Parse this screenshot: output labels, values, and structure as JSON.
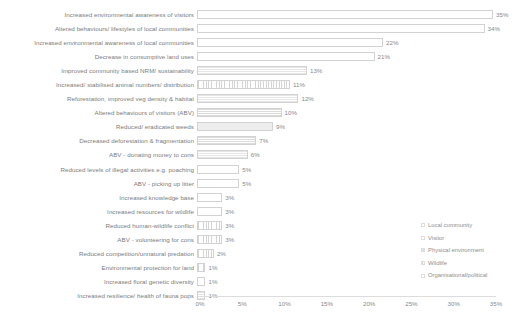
{
  "chart_data": {
    "type": "bar",
    "orientation": "horizontal",
    "title": "",
    "xlabel": "",
    "ylabel": "",
    "xlim": [
      0,
      35
    ],
    "grid": false,
    "legend_position": "right-lower",
    "tick_labels": [
      "0%",
      "5%",
      "10%",
      "15%",
      "20%",
      "25%",
      "30%",
      "35%"
    ],
    "tick_values": [
      0,
      5,
      10,
      15,
      20,
      25,
      30,
      35
    ],
    "categories": [
      "Increased environmental awareness of visitors",
      "Altered behaviours/ lifestyles of local communities",
      "Increased environmental awareness of local communities",
      "Decrease in consumptive land uses",
      "Improved community based NRM/ sustainability",
      "Increased/ stabilised animal numbers/ distribution",
      "Reforestation, improved veg density & habitat",
      "Altered behaviours of visitors (ABV)",
      "Reduced/ eradicated weeds",
      "Decreased deforestation & fragmentation",
      "ABV - donating money to cons",
      "Reduced levels of illegal activities e.g. poaching",
      "ABV - picking up litter",
      "Increased knowledge base",
      "Increased resources for wildlife",
      "Reduced human-wildlife conflict",
      "ABV - volunteering for cons",
      "Reduced competition/unnatural predation",
      "Environmental protection for land",
      "Increased floral genetic diversity",
      "Increased resilience/ health of fauna pops"
    ],
    "values": [
      35,
      34,
      22,
      21,
      13,
      11,
      12,
      10,
      9,
      7,
      6,
      5,
      5,
      3,
      3,
      3,
      3,
      2,
      1,
      1,
      1
    ],
    "value_labels": [
      "35%",
      "34%",
      "22%",
      "21%",
      "13%",
      "11%",
      "12%",
      "10%",
      "9%",
      "7%",
      "6%",
      "5%",
      "5%",
      "3%",
      "3%",
      "3%",
      "3%",
      "2%",
      "1%",
      "1%",
      "1%"
    ],
    "fills": [
      "plain",
      "plain",
      "plain",
      "plain",
      "hlines",
      "vlines",
      "hlines",
      "hdense",
      "solidlight",
      "hdense",
      "hlines",
      "plain",
      "plain",
      "plain",
      "plain",
      "vlines",
      "vlines",
      "vlines",
      "vlines",
      "plain",
      "hlines"
    ],
    "series_groups": [
      "Visitor",
      "Local community",
      "Local community",
      "Local community",
      "Organisational/political",
      "Wildlife",
      "Physical environment",
      "Visitor",
      "Physical environment",
      "Physical environment",
      "Visitor",
      "Organisational/political",
      "Visitor",
      "Local community",
      "Wildlife",
      "Local community",
      "Visitor",
      "Wildlife",
      "Organisational/political",
      "Physical environment",
      "Wildlife"
    ]
  },
  "legend": {
    "items": [
      {
        "label": "Local community",
        "swatch": "plain"
      },
      {
        "label": "Visitor",
        "swatch": "plain"
      },
      {
        "label": "Physical environment",
        "swatch": "hlines"
      },
      {
        "label": "Wildlife",
        "swatch": "vlines"
      },
      {
        "label": "Organisational/political",
        "swatch": "plain"
      }
    ]
  },
  "colors": {
    "bar_border": "#d2d2d2",
    "text": "#7b7b7b",
    "axis": "#dcdcdc",
    "background": "#ffffff"
  }
}
